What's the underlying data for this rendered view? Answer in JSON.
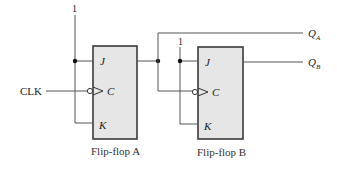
{
  "diagram": {
    "type": "circuit",
    "inputs": {
      "clock_label": "CLK"
    },
    "flip_flops": [
      {
        "name": "Flip-flop A",
        "logic_high_label": "1",
        "pins": {
          "j": "J",
          "clock": "C",
          "k": "K"
        },
        "output": {
          "letter": "Q",
          "subscript": "A"
        }
      },
      {
        "name": "Flip-flop B",
        "logic_high_label": "1",
        "pins": {
          "j": "J",
          "clock": "C",
          "k": "K"
        },
        "output": {
          "letter": "Q",
          "subscript": "B"
        }
      }
    ]
  }
}
